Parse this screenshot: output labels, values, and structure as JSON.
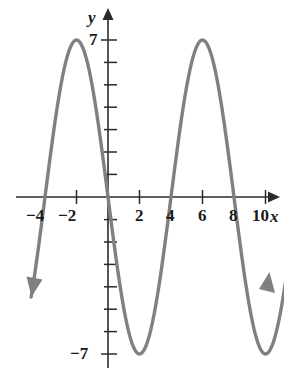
{
  "figure": {
    "title": "",
    "background_color": "#ffffff",
    "width": 284,
    "height": 370
  },
  "axes": {
    "x_axis_label": "x",
    "y_axis_label": "y",
    "axis_color": "#2b2b2b",
    "x_tick_labels": [
      "−4",
      "−2",
      "2",
      "4",
      "6",
      "8",
      "10"
    ],
    "x_tick_values": [
      -4,
      -2,
      2,
      4,
      6,
      8,
      10
    ],
    "y_tick_labels": [
      "7",
      "−7"
    ],
    "y_tick_values": [
      7,
      -7
    ]
  },
  "chart_data": {
    "type": "line",
    "title": "",
    "subtitle": "",
    "xlabel": "x",
    "ylabel": "y",
    "grid": false,
    "legend": null,
    "curve_color": "#808080",
    "xlim": [
      -5.2,
      11.6
    ],
    "ylim": [
      -8.4,
      8.4
    ],
    "xticks": [
      -4,
      -2,
      2,
      4,
      6,
      8,
      10
    ],
    "xticklabels": [
      "−4",
      "−2",
      "2",
      "4",
      "6",
      "8",
      "10"
    ],
    "yticks": [
      7,
      -7
    ],
    "yticklabels": [
      "7",
      "−7"
    ],
    "y_minor_ticks": [
      1,
      2,
      3,
      4,
      5,
      6,
      -1,
      -2,
      -3,
      -4,
      -5,
      -6
    ],
    "function": "y = -7 sin(pi x / 4)",
    "amplitude": 7,
    "period": 8,
    "maxima": [
      {
        "x": -2,
        "y": 7
      },
      {
        "x": 6,
        "y": 7
      }
    ],
    "minima": [
      {
        "x": 2,
        "y": -7
      },
      {
        "x": 10,
        "y": -7
      }
    ],
    "zeros": [
      -4,
      0,
      4,
      8
    ],
    "series": [
      {
        "name": "curve",
        "x": [
          -4.8,
          -4.4,
          -4.0,
          -3.6,
          -3.2,
          -2.8,
          -2.4,
          -2.0,
          -1.6,
          -1.2,
          -0.8,
          -0.4,
          0.0,
          0.4,
          0.8,
          1.2,
          1.6,
          2.0,
          2.4,
          2.8,
          3.2,
          3.6,
          4.0,
          4.4,
          4.8,
          5.2,
          5.6,
          6.0,
          6.4,
          6.8,
          7.2,
          7.6,
          8.0,
          8.4,
          8.8,
          9.2,
          9.6,
          10.0,
          10.4,
          10.8,
          11.2
        ],
        "y": [
          -5.66,
          -2.68,
          0.0,
          2.68,
          5.0,
          6.65,
          7.0,
          7.0,
          6.65,
          5.0,
          2.68,
          0.0,
          0.0,
          -2.68,
          -5.0,
          -6.65,
          -7.0,
          -7.0,
          -6.65,
          -5.0,
          -2.68,
          0.0,
          0.0,
          2.68,
          5.0,
          6.65,
          7.0,
          7.0,
          6.65,
          5.0,
          2.68,
          0.0,
          0.0,
          -2.68,
          -5.0,
          -6.65,
          -7.0,
          -7.0,
          -6.65,
          -5.0,
          -2.68
        ]
      }
    ],
    "end_arrows": [
      "down-left",
      "up-right"
    ]
  }
}
